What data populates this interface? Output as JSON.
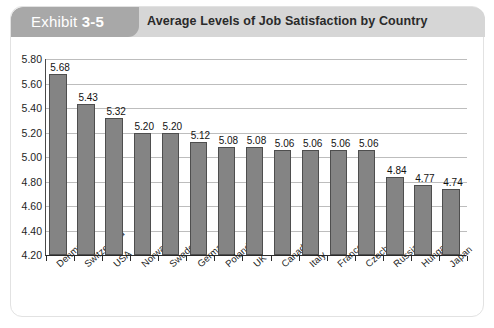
{
  "header": {
    "exhibit_label": "Exhibit",
    "exhibit_number": "3-5",
    "title": "Average Levels of Job Satisfaction by Country",
    "tab_color": "#a8a8a8",
    "band_color": "#d6d6d6"
  },
  "chart_data": {
    "type": "bar",
    "title": "Average Levels of Job Satisfaction by Country",
    "xlabel": "",
    "ylabel": "",
    "ylim": [
      4.2,
      5.8
    ],
    "ytick_step": 0.2,
    "ytick_labels": [
      "5.80",
      "5.60",
      "5.40",
      "5.20",
      "5.00",
      "4.80",
      "4.60",
      "4.40",
      "4.20"
    ],
    "grid": true,
    "legend": "none",
    "bar_color": "#848484",
    "bar_border_color": "#4e4e4e",
    "categories": [
      "Denmark",
      "Switzerland",
      "USA",
      "Norway",
      "Sweden",
      "Germany",
      "Poland",
      "UK",
      "Canada",
      "Italy",
      "France",
      "Czech Rep",
      "Russia",
      "Hungary",
      "Japan"
    ],
    "values": [
      5.68,
      5.43,
      5.32,
      5.2,
      5.2,
      5.12,
      5.08,
      5.08,
      5.06,
      5.06,
      5.06,
      5.06,
      4.84,
      4.77,
      4.74
    ],
    "value_labels": [
      "5.68",
      "5.43",
      "5.32",
      "5.20",
      "5.20",
      "5.12",
      "5.08",
      "5.08",
      "5.06",
      "5.06",
      "5.06",
      "5.06",
      "4.84",
      "4.77",
      "4.74"
    ]
  }
}
